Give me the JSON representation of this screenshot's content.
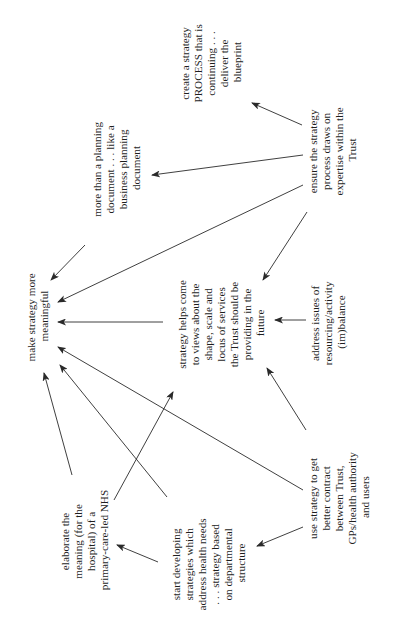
{
  "diagram": {
    "type": "influence-map",
    "orientation": "rotated-90-ccw",
    "text_color": "#1e1e1e",
    "line_color": "#2a2a2a",
    "nodes": [
      {
        "id": "make",
        "lines": [
          "make strategy more",
          "meaningful"
        ]
      },
      {
        "id": "more_than",
        "lines": [
          "more than a planning",
          "document . . . like a",
          "business planning",
          "document"
        ]
      },
      {
        "id": "create",
        "lines": [
          "create a strategy",
          "PROCESS that is",
          "continuing . . .",
          "deliver the",
          "blueprint"
        ]
      },
      {
        "id": "ensure",
        "lines": [
          "ensure the strategy",
          "process draws on",
          "expertise within the",
          "Trust"
        ]
      },
      {
        "id": "helps",
        "lines": [
          "strategy helps come",
          "to views about the",
          "shape, scale and",
          "locus of services",
          "the Trust should be",
          "providing in the",
          "future"
        ]
      },
      {
        "id": "address",
        "lines": [
          "address issues of",
          "resourcing/activity",
          "(im)balance"
        ]
      },
      {
        "id": "use",
        "lines": [
          "use strategy to get",
          "better contract",
          "between Trust,",
          "GPs/health authority",
          "and users"
        ]
      },
      {
        "id": "start",
        "lines": [
          "start developing",
          "strategies which",
          "address health needs",
          ". . . strategy based",
          "on departmental",
          "structure"
        ]
      },
      {
        "id": "elaborate",
        "lines": [
          "elaborate the",
          "meaning (for the",
          "hospital) of a",
          "primary-care-led NHS"
        ]
      }
    ],
    "edges": [
      {
        "from": "ensure",
        "to": "create"
      },
      {
        "from": "ensure",
        "to": "more_than"
      },
      {
        "from": "ensure",
        "to": "make"
      },
      {
        "from": "ensure",
        "to": "helps"
      },
      {
        "from": "more_than",
        "to": "make"
      },
      {
        "from": "helps",
        "to": "make"
      },
      {
        "from": "address",
        "to": "helps"
      },
      {
        "from": "use",
        "to": "helps"
      },
      {
        "from": "use",
        "to": "make"
      },
      {
        "from": "use",
        "to": "start"
      },
      {
        "from": "start",
        "to": "make"
      },
      {
        "from": "start",
        "to": "elaborate"
      },
      {
        "from": "elaborate",
        "to": "make"
      },
      {
        "from": "elaborate",
        "to": "helps"
      }
    ]
  }
}
